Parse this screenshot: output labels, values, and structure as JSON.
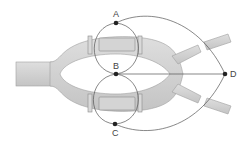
{
  "colors": {
    "river": "#cfcfcf",
    "river_edge": "#9a9a9a",
    "bridge": "#d6d6d6",
    "line": "#555555",
    "node": "#222222",
    "label": "#444444"
  },
  "nodes": [
    {
      "id": "A",
      "label": "A",
      "x": 116,
      "y": 23
    },
    {
      "id": "B",
      "label": "B",
      "x": 116,
      "y": 74
    },
    {
      "id": "C",
      "label": "C",
      "x": 115,
      "y": 124
    },
    {
      "id": "D",
      "label": "D",
      "x": 225,
      "y": 74
    }
  ],
  "edges": [
    [
      "A",
      "B"
    ],
    [
      "A",
      "B"
    ],
    [
      "B",
      "C"
    ],
    [
      "B",
      "C"
    ],
    [
      "A",
      "D"
    ],
    [
      "B",
      "D"
    ],
    [
      "C",
      "D"
    ]
  ]
}
